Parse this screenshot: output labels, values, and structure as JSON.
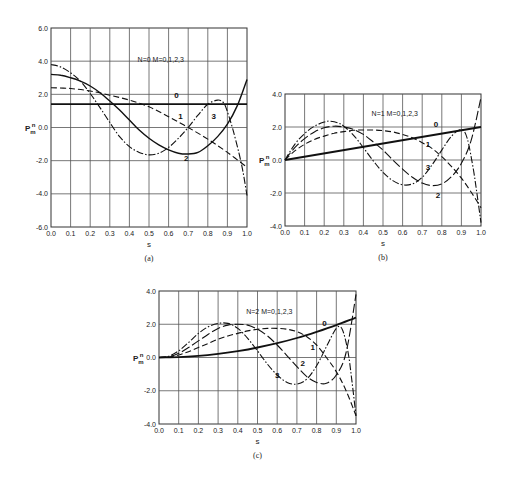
{
  "chart_data": [
    {
      "id": "a",
      "type": "line",
      "caption": "(a)",
      "title": "",
      "annotation": "N=0   M=0,1,2,3",
      "xlabel": "s",
      "ylabel": "P_m^n",
      "xlim": [
        0.0,
        1.0
      ],
      "ylim": [
        -6.0,
        6.0
      ],
      "xticks": [
        "0.0",
        "0.1",
        "0.2",
        "0.3",
        "0.4",
        "0.5",
        "0.6",
        "0.7",
        "0.8",
        "0.9",
        "1.0"
      ],
      "yticks": [
        "6.0",
        "4.0",
        "2.0",
        "0.0",
        "-2.0",
        "-4.0",
        "-6.0"
      ],
      "grid": true,
      "plot_box": {
        "x0": 51,
        "x1": 247,
        "y_top": 28,
        "y_bottom": 227
      },
      "series": [
        {
          "name": "0",
          "style": "solid-thick",
          "label_pos": [
            0.64,
            1.95
          ],
          "x": [
            0.0,
            1.0
          ],
          "y": [
            1.41,
            1.41
          ]
        },
        {
          "name": "1",
          "style": "dashed",
          "label_pos": [
            0.66,
            0.7
          ],
          "x": [
            0.0,
            0.1,
            0.2,
            0.3,
            0.4,
            0.5,
            0.6,
            0.7,
            0.8,
            0.9,
            1.0
          ],
          "y": [
            2.4,
            2.35,
            2.2,
            1.95,
            1.65,
            1.25,
            0.65,
            0.0,
            -0.7,
            -1.5,
            -2.4
          ]
        },
        {
          "name": "2",
          "style": "solid",
          "label_pos": [
            0.69,
            -1.85
          ],
          "x": [
            0.0,
            0.05,
            0.1,
            0.15,
            0.2,
            0.25,
            0.3,
            0.35,
            0.4,
            0.45,
            0.5,
            0.55,
            0.6,
            0.65,
            0.7,
            0.75,
            0.8,
            0.85,
            0.9,
            0.95,
            1.0
          ],
          "y": [
            3.2,
            3.15,
            3.0,
            2.8,
            2.5,
            2.1,
            1.6,
            1.05,
            0.45,
            -0.15,
            -0.65,
            -1.05,
            -1.35,
            -1.55,
            -1.6,
            -1.5,
            -1.1,
            -0.55,
            0.2,
            1.3,
            2.9
          ]
        },
        {
          "name": "3",
          "style": "dash-dot",
          "label_pos": [
            0.83,
            0.7
          ],
          "x": [
            0.0,
            0.05,
            0.1,
            0.15,
            0.2,
            0.25,
            0.3,
            0.35,
            0.4,
            0.45,
            0.5,
            0.55,
            0.6,
            0.65,
            0.7,
            0.75,
            0.8,
            0.85,
            0.88,
            0.9,
            0.93,
            0.96,
            0.98,
            1.0
          ],
          "y": [
            3.8,
            3.65,
            3.3,
            2.8,
            2.05,
            1.2,
            0.3,
            -0.55,
            -1.15,
            -1.5,
            -1.65,
            -1.55,
            -1.2,
            -0.65,
            0.0,
            0.75,
            1.4,
            1.65,
            1.5,
            0.95,
            -0.2,
            -1.6,
            -2.7,
            -4.1
          ]
        }
      ]
    },
    {
      "id": "b",
      "type": "line",
      "caption": "(b)",
      "title": "",
      "annotation": "N=1   M=0,1,2,3",
      "xlabel": "s",
      "ylabel": "P_m^n",
      "xlim": [
        0.0,
        1.0
      ],
      "ylim": [
        -4.0,
        4.0
      ],
      "xticks": [
        "0.0",
        "0.1",
        "0.2",
        "0.3",
        "0.4",
        "0.5",
        "0.6",
        "0.7",
        "0.8",
        "0.9",
        "1.0"
      ],
      "yticks": [
        "4.0",
        "2.0",
        "0.0",
        "-2.0",
        "-4.0"
      ],
      "grid": true,
      "plot_box": {
        "x0": 285,
        "x1": 481,
        "y_top": 94,
        "y_bottom": 226
      },
      "series": [
        {
          "name": "0",
          "style": "solid-thick",
          "label_pos": [
            0.77,
            2.2
          ],
          "x": [
            0.0,
            1.0
          ],
          "y": [
            0.0,
            2.0
          ]
        },
        {
          "name": "1",
          "style": "dashed",
          "label_pos": [
            0.73,
            1.0
          ],
          "x": [
            0.0,
            0.05,
            0.1,
            0.15,
            0.2,
            0.25,
            0.3,
            0.35,
            0.4,
            0.45,
            0.5,
            0.55,
            0.6,
            0.65,
            0.7,
            0.75,
            0.8,
            0.85,
            0.9,
            0.95,
            1.0
          ],
          "y": [
            0.0,
            0.55,
            0.95,
            1.25,
            1.45,
            1.62,
            1.72,
            1.8,
            1.82,
            1.82,
            1.78,
            1.7,
            1.55,
            1.35,
            1.05,
            0.7,
            0.2,
            -0.4,
            -1.1,
            -1.95,
            -2.9
          ]
        },
        {
          "name": "2",
          "style": "dash-long",
          "label_pos": [
            0.78,
            -2.1
          ],
          "x": [
            0.0,
            0.05,
            0.1,
            0.15,
            0.2,
            0.25,
            0.3,
            0.35,
            0.4,
            0.45,
            0.5,
            0.55,
            0.6,
            0.65,
            0.7,
            0.75,
            0.8,
            0.85,
            0.9,
            0.95,
            1.0
          ],
          "y": [
            0.0,
            0.75,
            1.3,
            1.7,
            1.95,
            2.05,
            2.0,
            1.85,
            1.55,
            1.1,
            0.6,
            0.0,
            -0.55,
            -1.05,
            -1.4,
            -1.55,
            -1.45,
            -1.0,
            -0.2,
            1.2,
            3.8
          ]
        },
        {
          "name": "3",
          "style": "dash-dot",
          "label_pos": [
            0.73,
            -0.4
          ],
          "x": [
            0.0,
            0.05,
            0.1,
            0.15,
            0.2,
            0.23,
            0.27,
            0.3,
            0.35,
            0.4,
            0.45,
            0.5,
            0.55,
            0.6,
            0.65,
            0.7,
            0.75,
            0.8,
            0.85,
            0.9,
            0.93,
            0.96,
            0.98,
            1.0
          ],
          "y": [
            0.0,
            0.95,
            1.6,
            2.05,
            2.3,
            2.35,
            2.25,
            2.05,
            1.5,
            0.75,
            -0.05,
            -0.75,
            -1.25,
            -1.5,
            -1.45,
            -1.05,
            -0.3,
            0.6,
            1.45,
            1.85,
            1.3,
            -0.5,
            -2.1,
            -3.8
          ]
        }
      ]
    },
    {
      "id": "c",
      "type": "line",
      "caption": "(c)",
      "title": "",
      "annotation": "N=2   M=0,1,2,3",
      "xlabel": "s",
      "ylabel": "P_m^n",
      "xlim": [
        0.0,
        1.0
      ],
      "ylim": [
        -4.0,
        4.0
      ],
      "xticks": [
        "0.0",
        "0.1",
        "0.2",
        "0.3",
        "0.4",
        "0.5",
        "0.6",
        "0.7",
        "0.8",
        "0.9",
        "1.0"
      ],
      "yticks": [
        "4.0",
        "2.0",
        "0.0",
        "-2.0",
        "-4.0"
      ],
      "grid": true,
      "plot_box": {
        "x0": 159,
        "x1": 356,
        "y_top": 291,
        "y_bottom": 424
      },
      "series": [
        {
          "name": "0",
          "style": "solid-thick",
          "label_pos": [
            0.84,
            2.1
          ],
          "x": [
            0.0,
            0.1,
            0.2,
            0.3,
            0.4,
            0.5,
            0.6,
            0.7,
            0.8,
            0.9,
            1.0
          ],
          "y": [
            0.0,
            0.02,
            0.1,
            0.22,
            0.38,
            0.6,
            0.86,
            1.17,
            1.54,
            1.95,
            2.4
          ]
        },
        {
          "name": "1",
          "style": "dashed",
          "label_pos": [
            0.78,
            0.65
          ],
          "x": [
            0.0,
            0.05,
            0.1,
            0.15,
            0.2,
            0.25,
            0.3,
            0.35,
            0.4,
            0.45,
            0.5,
            0.55,
            0.6,
            0.65,
            0.7,
            0.75,
            0.8,
            0.85,
            0.9,
            0.95,
            1.0
          ],
          "y": [
            0.0,
            0.03,
            0.15,
            0.35,
            0.6,
            0.85,
            1.1,
            1.3,
            1.45,
            1.6,
            1.7,
            1.75,
            1.75,
            1.7,
            1.55,
            1.25,
            0.75,
            0.0,
            -0.85,
            -2.0,
            -3.5
          ]
        },
        {
          "name": "2",
          "style": "dash-long",
          "label_pos": [
            0.73,
            -0.35
          ],
          "x": [
            0.0,
            0.05,
            0.1,
            0.15,
            0.2,
            0.25,
            0.3,
            0.35,
            0.4,
            0.45,
            0.5,
            0.55,
            0.6,
            0.65,
            0.7,
            0.75,
            0.8,
            0.85,
            0.9,
            0.95,
            1.0
          ],
          "y": [
            0.0,
            0.05,
            0.25,
            0.6,
            1.0,
            1.4,
            1.75,
            1.95,
            2.0,
            1.95,
            1.7,
            1.3,
            0.75,
            0.1,
            -0.55,
            -1.15,
            -1.5,
            -1.55,
            -1.05,
            0.3,
            3.8
          ]
        },
        {
          "name": "3",
          "style": "dash-dot",
          "label_pos": [
            0.6,
            -1.05
          ],
          "x": [
            0.0,
            0.05,
            0.1,
            0.15,
            0.2,
            0.25,
            0.3,
            0.35,
            0.4,
            0.45,
            0.5,
            0.55,
            0.6,
            0.65,
            0.7,
            0.75,
            0.8,
            0.85,
            0.9,
            0.93,
            0.96,
            0.98,
            1.0
          ],
          "y": [
            0.0,
            0.08,
            0.4,
            0.9,
            1.45,
            1.85,
            2.05,
            2.05,
            1.75,
            1.15,
            0.4,
            -0.4,
            -1.05,
            -1.5,
            -1.6,
            -1.3,
            -0.5,
            0.65,
            1.75,
            1.7,
            0.3,
            -1.5,
            -3.5
          ]
        }
      ]
    }
  ]
}
